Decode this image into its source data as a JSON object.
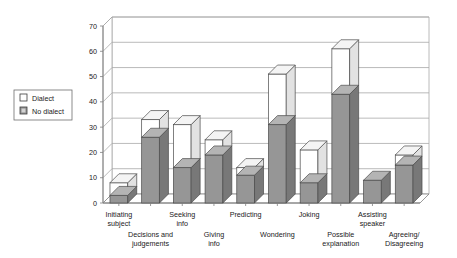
{
  "chart_data": {
    "type": "bar",
    "subtype": "stacked-column-3d",
    "title": "",
    "xlabel": "",
    "ylabel": "",
    "ylim": [
      0,
      70
    ],
    "ytick_step": 10,
    "yticks": [
      0,
      10,
      20,
      30,
      40,
      50,
      60,
      70
    ],
    "grid": true,
    "legend_position": "outside-left-top",
    "categories": [
      "Initiating subject",
      "Decisions and judgements",
      "Seeking info",
      "Giving info",
      "Predicting",
      "Wondering",
      "Joking",
      "Possible explanation",
      "Assisting speaker",
      "Agreeing/ Disagreeing"
    ],
    "category_lines": [
      [
        "Initiating",
        "subject"
      ],
      [
        "Decisions and",
        "judgements"
      ],
      [
        "Seeking",
        "info"
      ],
      [
        "Giving",
        "info"
      ],
      [
        "Predicting"
      ],
      [
        "Wondering"
      ],
      [
        "Joking"
      ],
      [
        "Possible",
        "explanation"
      ],
      [
        "Assisting",
        "speaker"
      ],
      [
        "Agreeing/",
        "Disagreeing"
      ]
    ],
    "series": [
      {
        "name": "No dialect",
        "color": "#969696",
        "values": [
          3,
          26,
          14,
          19,
          11,
          31,
          8,
          43,
          9,
          15
        ]
      },
      {
        "name": "Dialect",
        "color": "#ffffff",
        "values": [
          5,
          7,
          17,
          6,
          3,
          20,
          13,
          18,
          0,
          4
        ]
      }
    ],
    "totals": [
      8,
      33,
      31,
      25,
      14,
      51,
      21,
      61,
      9,
      19
    ],
    "legend": [
      {
        "label": "Dialect",
        "swatch": "white"
      },
      {
        "label": "No dialect",
        "swatch": "gray"
      }
    ]
  }
}
